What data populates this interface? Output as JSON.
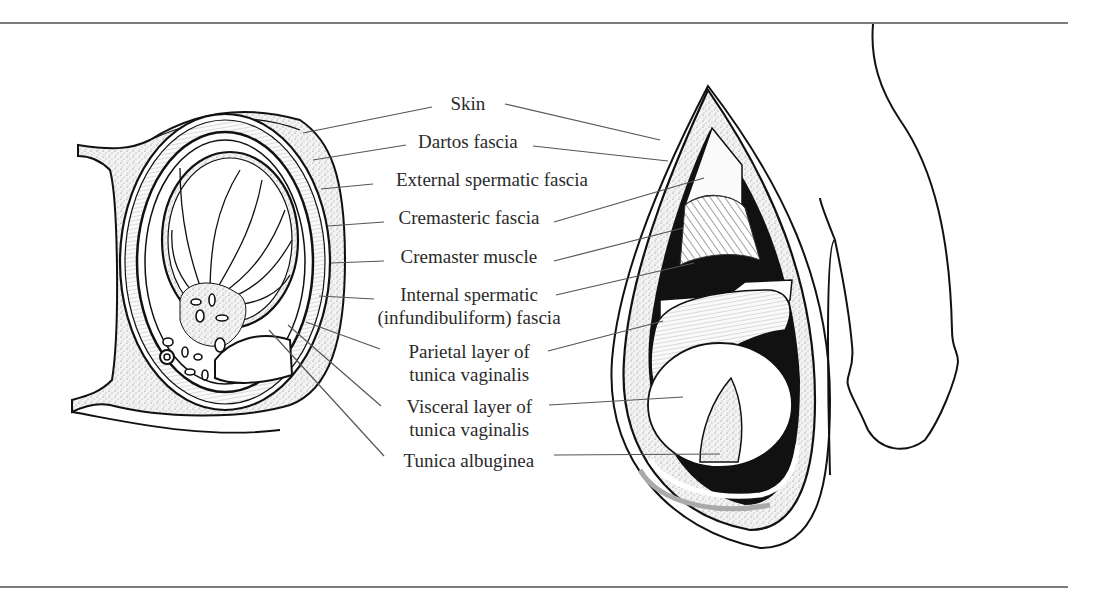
{
  "figure": {
    "type": "anatomical illustration",
    "colors": {
      "ink": "#111111",
      "leader": "#555555",
      "text": "#2a2a2a",
      "rule": "#7a7a7a",
      "stipple": "#9a9a9a"
    }
  },
  "labels": [
    {
      "id": "skin",
      "text": "Skin",
      "x": 468,
      "y": 96,
      "lines": 1,
      "leaders": [
        [
          432,
          107,
          303,
          133
        ],
        [
          505,
          104,
          660,
          140
        ]
      ]
    },
    {
      "id": "dartos",
      "text": "Dartos fascia",
      "x": 468,
      "y": 134,
      "lines": 1,
      "leaders": [
        [
          406,
          145,
          313,
          160
        ],
        [
          533,
          146,
          668,
          161
        ]
      ]
    },
    {
      "id": "external-spermatic",
      "text": "External spermatic fascia",
      "x": 492,
      "y": 172,
      "lines": 1,
      "leaders": [
        [
          373,
          184,
          321,
          189
        ]
      ]
    },
    {
      "id": "cremasteric",
      "text": "Cremasteric fascia",
      "x": 469,
      "y": 210,
      "lines": 1,
      "leaders": [
        [
          384,
          222,
          328,
          226
        ],
        [
          554,
          222,
          704,
          178
        ]
      ]
    },
    {
      "id": "cremaster-muscle",
      "text": "Cremaster muscle",
      "x": 469,
      "y": 249,
      "lines": 1,
      "leaders": [
        [
          384,
          261,
          331,
          263
        ],
        [
          554,
          261,
          683,
          228
        ]
      ]
    },
    {
      "id": "internal-spermatic",
      "text": [
        "Internal spermatic",
        "(infundibuliform) fascia"
      ],
      "x": 469,
      "y": 287,
      "lines": 2,
      "leaders": [
        [
          374,
          299,
          319,
          296
        ],
        [
          556,
          295,
          694,
          263
        ]
      ]
    },
    {
      "id": "parietal",
      "text": [
        "Parietal layer of",
        "tunica vaginalis"
      ],
      "x": 469,
      "y": 344,
      "lines": 2,
      "leaders": [
        [
          380,
          349,
          306,
          322
        ],
        [
          548,
          351,
          663,
          321
        ]
      ]
    },
    {
      "id": "visceral",
      "text": [
        "Visceral layer of",
        "tunica vaginalis"
      ],
      "x": 469,
      "y": 399,
      "lines": 2,
      "leaders": [
        [
          381,
          406,
          288,
          325
        ],
        [
          549,
          405,
          683,
          397
        ]
      ]
    },
    {
      "id": "albuginea",
      "text": "Tunica albuginea",
      "x": 469,
      "y": 453,
      "lines": 1,
      "leaders": [
        [
          384,
          456,
          269,
          330
        ],
        [
          554,
          455,
          720,
          454
        ]
      ]
    }
  ],
  "rules": {
    "top_y": 22,
    "bottom_y": 586
  }
}
